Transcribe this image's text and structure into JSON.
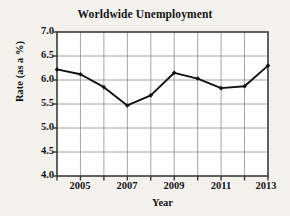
{
  "chart_data": {
    "type": "line",
    "title": "Worldwide Unemployment",
    "xlabel": "Year",
    "ylabel": "Rate (as a %)",
    "x": [
      2004,
      2005,
      2006,
      2007,
      2008,
      2009,
      2010,
      2011,
      2012,
      2013
    ],
    "values": [
      6.22,
      6.12,
      5.85,
      5.47,
      5.68,
      6.15,
      6.03,
      5.83,
      5.87,
      6.3
    ],
    "series": [
      {
        "name": "Unemployment rate",
        "values": [
          6.22,
          6.12,
          5.85,
          5.47,
          5.68,
          6.15,
          6.03,
          5.83,
          5.87,
          6.3
        ]
      }
    ],
    "xlim": [
      2004,
      2013
    ],
    "ylim": [
      4.0,
      7.0
    ],
    "y_ticks": [
      4.0,
      4.5,
      5.0,
      5.5,
      6.0,
      6.5,
      7.0
    ],
    "y_tick_labels": [
      "4.0",
      "4.5",
      "5.0",
      "5.5",
      "6.0",
      "6.5",
      "7.0"
    ],
    "x_ticks": [
      2004,
      2005,
      2006,
      2007,
      2008,
      2009,
      2010,
      2011,
      2012,
      2013
    ],
    "x_tick_labels": [
      "2005",
      "2007",
      "2009",
      "2011",
      "2013"
    ],
    "x_labeled_ticks": [
      2005,
      2007,
      2009,
      2011,
      2013
    ],
    "grid": true,
    "legend": "none",
    "marker": "diamond",
    "line_color": "#111111",
    "grid_color": "#9a9a9a",
    "axis_color": "#3a3a3a",
    "plot_background": "#ffffff",
    "figure_background": "#f3f2ef"
  }
}
